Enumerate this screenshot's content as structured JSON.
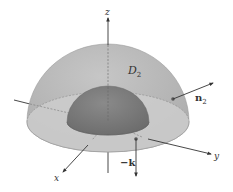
{
  "figure": {
    "labels": {
      "region": "D",
      "region_sub": "2",
      "normal": "n",
      "normal_sub": "2",
      "neg_k": "−k",
      "axis_x": "x",
      "axis_y": "y",
      "axis_z": "z"
    },
    "colors": {
      "outer_dome": "#b8b8b8",
      "outer_dome_edge": "#9a9a9a",
      "base_ring": "#c9c9c9",
      "inner_dome": "#7f7f7f",
      "inner_dome_dark": "#6e6e6e",
      "axis": "#333333",
      "background": "#ffffff"
    }
  }
}
